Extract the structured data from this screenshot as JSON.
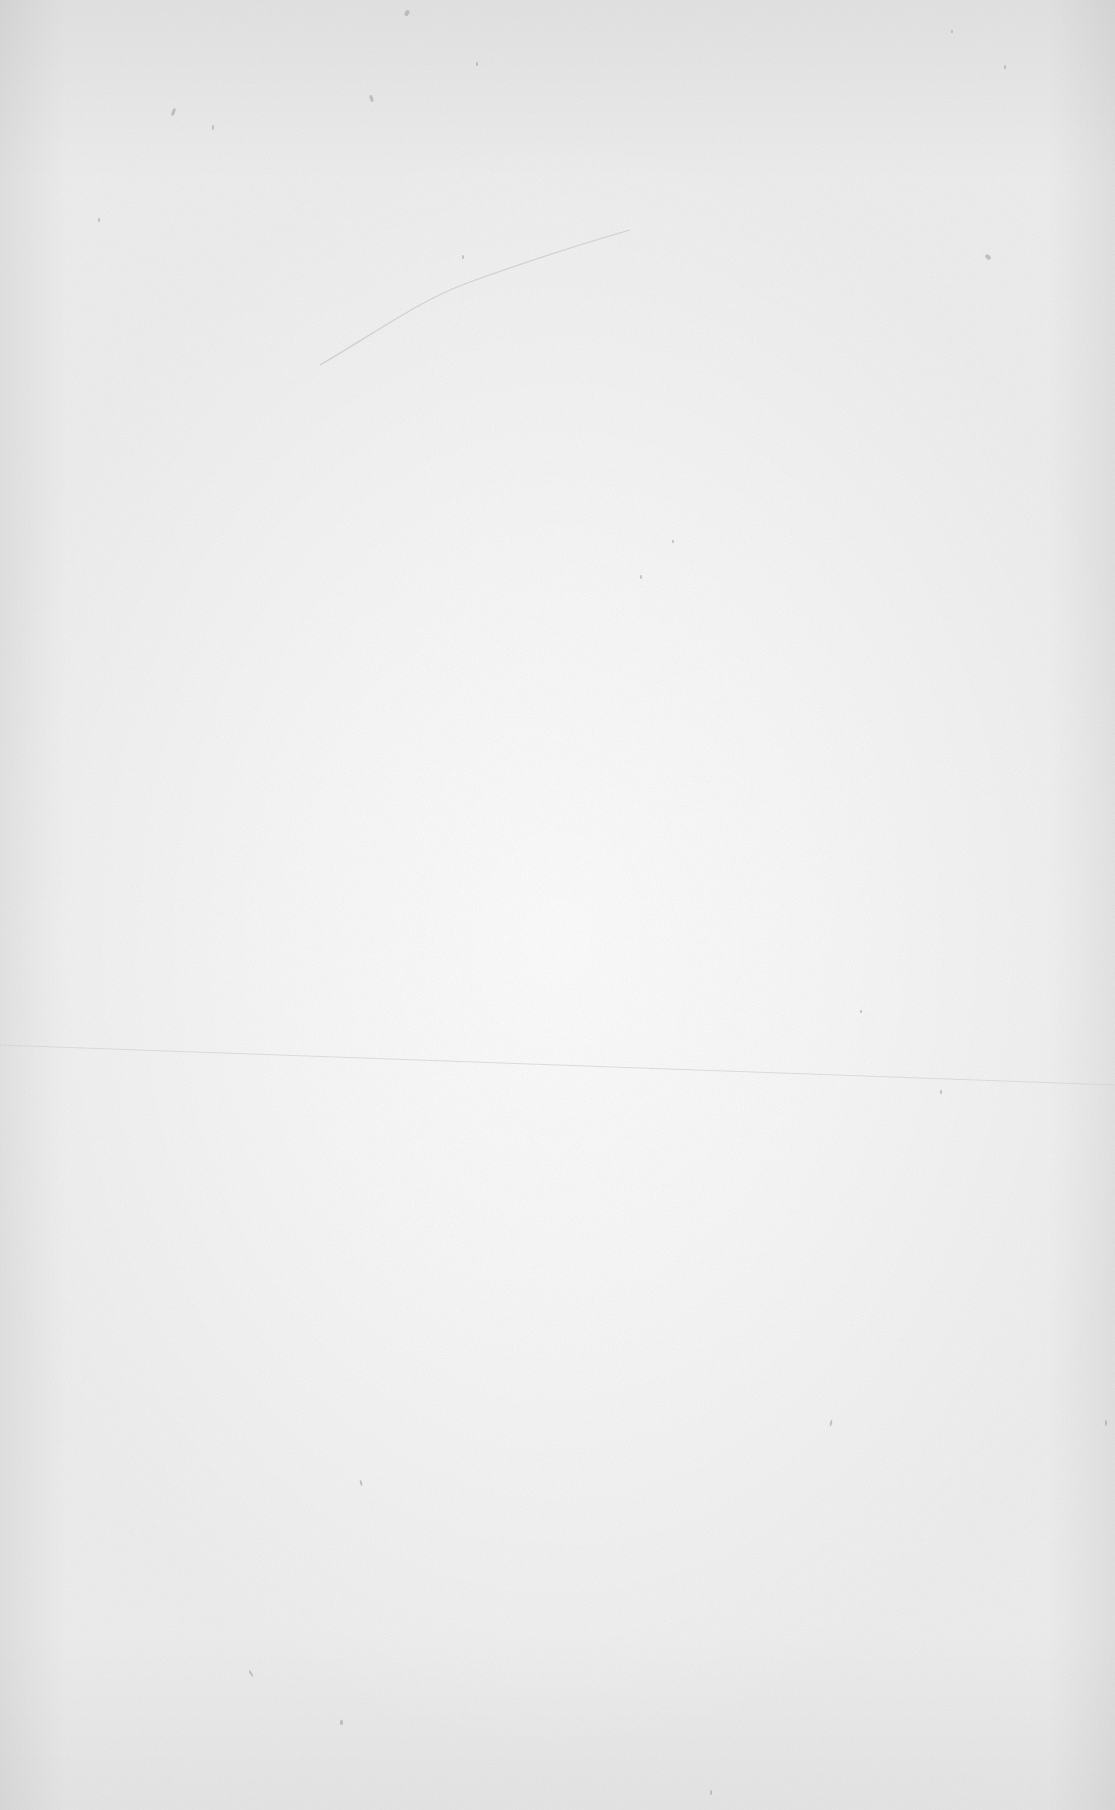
{
  "document": {
    "type": "blank-page",
    "text": "",
    "paper": {
      "base_color": "#efefef",
      "center_color": "#ffffff",
      "speck_color": "#9a9a9a",
      "crease_color": "#c8c8c8"
    },
    "marks": {
      "diagonal_crease": {
        "x1": 320,
        "y1": 365,
        "x2": 630,
        "y2": 230
      },
      "horizontal_fold": {
        "x1": 0,
        "y1": 1045,
        "x2": 1115,
        "y2": 1085
      },
      "specks": [
        {
          "x": 172,
          "y": 108,
          "w": 3,
          "h": 8,
          "r": 20
        },
        {
          "x": 212,
          "y": 125,
          "w": 2,
          "h": 5,
          "r": 0
        },
        {
          "x": 370,
          "y": 95,
          "w": 3,
          "h": 7,
          "r": -20
        },
        {
          "x": 405,
          "y": 10,
          "w": 4,
          "h": 6,
          "r": 30
        },
        {
          "x": 462,
          "y": 255,
          "w": 2,
          "h": 4,
          "r": 0
        },
        {
          "x": 476,
          "y": 62,
          "w": 2,
          "h": 4,
          "r": 0
        },
        {
          "x": 985,
          "y": 255,
          "w": 6,
          "h": 4,
          "r": 40
        },
        {
          "x": 951,
          "y": 30,
          "w": 2,
          "h": 3,
          "r": 0
        },
        {
          "x": 1004,
          "y": 65,
          "w": 2,
          "h": 4,
          "r": 0
        },
        {
          "x": 98,
          "y": 218,
          "w": 2,
          "h": 4,
          "r": 0
        },
        {
          "x": 640,
          "y": 575,
          "w": 2,
          "h": 4,
          "r": 0
        },
        {
          "x": 672,
          "y": 540,
          "w": 2,
          "h": 3,
          "r": 0
        },
        {
          "x": 860,
          "y": 1010,
          "w": 2,
          "h": 3,
          "r": 0
        },
        {
          "x": 940,
          "y": 1090,
          "w": 2,
          "h": 4,
          "r": 0
        },
        {
          "x": 360,
          "y": 1480,
          "w": 2,
          "h": 6,
          "r": -15
        },
        {
          "x": 250,
          "y": 1670,
          "w": 2,
          "h": 7,
          "r": -30
        },
        {
          "x": 340,
          "y": 1720,
          "w": 3,
          "h": 5,
          "r": 0
        },
        {
          "x": 830,
          "y": 1420,
          "w": 2,
          "h": 6,
          "r": 10
        },
        {
          "x": 710,
          "y": 1790,
          "w": 2,
          "h": 5,
          "r": 0
        },
        {
          "x": 1105,
          "y": 1420,
          "w": 2,
          "h": 6,
          "r": 0
        }
      ]
    }
  }
}
